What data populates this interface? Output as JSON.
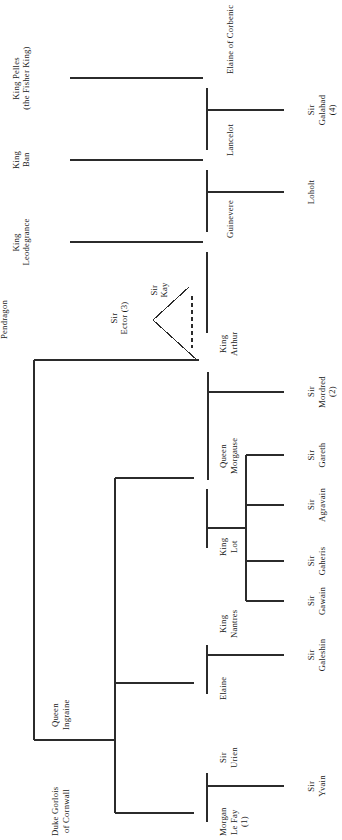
{
  "diagram": {
    "orientation": "rotated-90-ccw",
    "line_color": "#2b2b2b",
    "background": "#ffffff",
    "people": [
      {
        "id": "pelles",
        "name": "King Pelles\n(the Fisher King)",
        "x": 60,
        "y": 78,
        "align": "end"
      },
      {
        "id": "ban",
        "name": "King\nBan",
        "x": 60,
        "y": 160,
        "align": "end"
      },
      {
        "id": "leodegrance",
        "name": "King\nLeodegrance",
        "x": 60,
        "y": 242,
        "align": "end"
      },
      {
        "id": "uther",
        "name": "King\nUther\nPendragon",
        "x": 46,
        "y": 360,
        "align": "end"
      },
      {
        "id": "ector",
        "name": "Sir\nEctor (3)",
        "x": 136,
        "y": 318,
        "align": "end"
      },
      {
        "id": "kay",
        "name": "Sir\nKay",
        "x": 188,
        "y": 291,
        "align": "end"
      },
      {
        "id": "elaine_corbenic",
        "name": "Elaine of Corbenic",
        "x": 205,
        "y": 62,
        "align": "start"
      },
      {
        "id": "lancelot",
        "name": "Lancelot",
        "x": 205,
        "y": 143,
        "align": "start"
      },
      {
        "id": "guinevere",
        "name": "Guinevere",
        "x": 205,
        "y": 225,
        "align": "start"
      },
      {
        "id": "arthur",
        "name": "King\nArthur",
        "x": 198,
        "y": 348,
        "align": "start"
      },
      {
        "id": "galahad",
        "name": "Sir\nGalahad\n(4)",
        "x": 288,
        "y": 110,
        "align": "start"
      },
      {
        "id": "loholt",
        "name": "Loholt",
        "x": 288,
        "y": 192,
        "align": "start"
      },
      {
        "id": "mordred",
        "name": "Sir\nMordred\n(2)",
        "x": 288,
        "y": 392,
        "align": "start"
      },
      {
        "id": "morgause",
        "name": "Queen\nMorgause",
        "x": 198,
        "y": 478,
        "align": "start"
      },
      {
        "id": "lot",
        "name": "King\nLot",
        "x": 198,
        "y": 537,
        "align": "start"
      },
      {
        "id": "gareth",
        "name": "Sir\nGareth",
        "x": 288,
        "y": 455,
        "align": "start"
      },
      {
        "id": "agravain",
        "name": "Sir\nAgravain",
        "x": 288,
        "y": 505,
        "align": "start"
      },
      {
        "id": "gaheris",
        "name": "Sir\nGaheris",
        "x": 288,
        "y": 561,
        "align": "start"
      },
      {
        "id": "gawain",
        "name": "Sir\nGawain",
        "x": 288,
        "y": 601,
        "align": "start"
      },
      {
        "id": "elaine",
        "name": "Elaine",
        "x": 198,
        "y": 683,
        "align": "start"
      },
      {
        "id": "nantres",
        "name": "King\nNantres",
        "x": 198,
        "y": 633,
        "align": "start"
      },
      {
        "id": "galeshin",
        "name": "Sir\nGaleshin",
        "x": 288,
        "y": 655,
        "align": "start"
      },
      {
        "id": "gorlois",
        "name": "Duke Gorlois\nof Cornwall",
        "x": 46,
        "y": 740,
        "align": "start"
      },
      {
        "id": "ingraine",
        "name": "Queen\nIngraine",
        "x": 46,
        "y": 681,
        "align": "start"
      },
      {
        "id": "morgan",
        "name": "Morgan\nLe Fay\n(1)",
        "x": 198,
        "y": 813,
        "align": "start"
      },
      {
        "id": "urien",
        "name": "Sir\nUrien",
        "x": 198,
        "y": 761,
        "align": "start"
      },
      {
        "id": "yvain",
        "name": "Sir\nYvain",
        "x": 288,
        "y": 786,
        "align": "start"
      }
    ],
    "footnotes": [
      "(1)",
      "(2)",
      "(3)",
      "(4)"
    ]
  }
}
